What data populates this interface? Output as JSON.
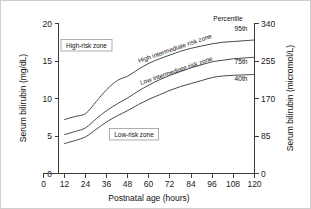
{
  "chart_data": {
    "type": "line",
    "title": "",
    "xlabel": "Postnatal age (hours)",
    "ylabel": "Serum bilirubin (mg/dL)",
    "ylabel_right": "Serum bilirubin (micromol/L)",
    "xlim": [
      0,
      120
    ],
    "ylim": [
      0,
      20
    ],
    "ylim_right": [
      0,
      340
    ],
    "grid": false,
    "legend_position": "right-inline",
    "xticks": [
      "0",
      "12",
      "24",
      "36",
      "48",
      "60",
      "72",
      "84",
      "96",
      "108",
      "120"
    ],
    "xtick_values": [
      0,
      12,
      24,
      36,
      48,
      60,
      72,
      84,
      96,
      108,
      120
    ],
    "yticks": [
      "0",
      "5",
      "10",
      "15",
      "20"
    ],
    "ytick_values": [
      0,
      5,
      10,
      15,
      20
    ],
    "yticks_right": [
      "0",
      "85",
      "170",
      "255",
      "340"
    ],
    "ytick_values_right": [
      0,
      85,
      170,
      255,
      340
    ],
    "x": [
      12,
      18,
      24,
      30,
      36,
      42,
      48,
      54,
      60,
      66,
      72,
      78,
      84,
      90,
      96,
      102,
      108,
      114,
      120
    ],
    "series": [
      {
        "name": "95th",
        "label": "95th",
        "values": [
          7.2,
          7.6,
          8.0,
          9.6,
          11.2,
          12.4,
          13.0,
          13.9,
          14.7,
          15.3,
          15.8,
          16.3,
          16.7,
          17.0,
          17.3,
          17.5,
          17.6,
          17.7,
          17.8
        ]
      },
      {
        "name": "75th",
        "label": "75th",
        "values": [
          5.2,
          5.6,
          6.1,
          7.3,
          8.4,
          9.3,
          10.1,
          11.0,
          11.8,
          12.5,
          13.1,
          13.6,
          14.1,
          14.5,
          14.9,
          15.1,
          15.3,
          15.4,
          15.5
        ]
      },
      {
        "name": "40th",
        "label": "40th",
        "values": [
          4.0,
          4.4,
          4.9,
          5.9,
          6.9,
          7.7,
          8.4,
          9.2,
          9.9,
          10.5,
          11.1,
          11.6,
          12.0,
          12.4,
          12.8,
          13.0,
          13.1,
          13.15,
          13.2
        ]
      }
    ],
    "annotations": [
      {
        "name": "high-risk-zone",
        "text": "High-risk zone",
        "boxed": true
      },
      {
        "name": "low-risk-zone",
        "text": "Low-risk zone",
        "boxed": true
      },
      {
        "name": "high-intermediate-risk-zone",
        "text": "High intermediate risk zone",
        "boxed": false,
        "rotated": true
      },
      {
        "name": "low-intermediate-risk-zone",
        "text": "Low intermediate risk zone",
        "boxed": false,
        "rotated": true
      },
      {
        "name": "percentile-heading",
        "text": "Percentile",
        "boxed": false
      }
    ],
    "colors": {
      "curve": "#4a4a4a",
      "axis": "#3b3b3b",
      "text": "#111111",
      "background": "#ffffff",
      "border": "#cfcfcf",
      "box_border": "#8a8a8a"
    }
  },
  "axes": {
    "x_title": "Postnatal age (hours)",
    "y_left_title": "Serum bilirubin (mg/dL)",
    "y_right_title": "Serum bilirubin (micromol/L)",
    "x_ticks": [
      "0",
      "12",
      "24",
      "36",
      "48",
      "60",
      "72",
      "84",
      "96",
      "108",
      "120"
    ],
    "y_left_ticks": [
      "0",
      "5",
      "10",
      "15",
      "20"
    ],
    "y_right_ticks": [
      "0",
      "85",
      "170",
      "255",
      "340"
    ]
  },
  "labels": {
    "percentile_heading": "Percentile",
    "pct_95": "95th",
    "pct_75": "75th",
    "pct_40": "40th",
    "high_risk_zone": "High-risk zone",
    "low_risk_zone": "Low-risk zone",
    "high_intermediate_zone": "High intermediate risk zone",
    "low_intermediate_zone": "Low intermediate risk zone"
  }
}
